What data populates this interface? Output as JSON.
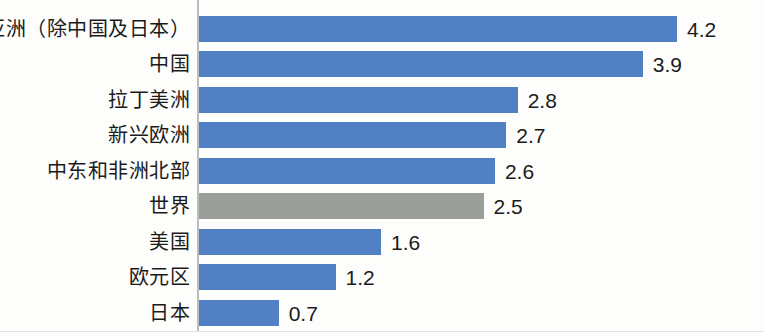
{
  "chart_data": {
    "type": "bar",
    "orientation": "horizontal",
    "title": "",
    "subtitle": "",
    "xlabel": "",
    "ylabel": "",
    "grid": false,
    "legend": null,
    "xlim": [
      0,
      4.95
    ],
    "categories": [
      "亚洲（除中国及日本）",
      "中国",
      "拉丁美洲",
      "新兴欧洲",
      "中东和非洲北部",
      "世界",
      "美国",
      "欧元区",
      "日本"
    ],
    "values": [
      4.2,
      3.9,
      2.8,
      2.7,
      2.6,
      2.5,
      1.6,
      1.2,
      0.7
    ],
    "value_labels": [
      "4.2",
      "3.9",
      "2.8",
      "2.7",
      "2.6",
      "2.5",
      "1.6",
      "1.2",
      "0.7"
    ],
    "bar_colors": [
      "#5180c4",
      "#5180c4",
      "#5180c4",
      "#5180c4",
      "#5180c4",
      "#9b9f9a",
      "#5180c4",
      "#5180c4",
      "#5180c4"
    ],
    "highlight_category": "世界",
    "colors": {
      "series_blue": "#5180c4",
      "highlight_gray": "#9b9f9a",
      "axis_line": "#b9bdbf",
      "text": "#1b1b1b",
      "background": "#fdfdfc"
    }
  }
}
